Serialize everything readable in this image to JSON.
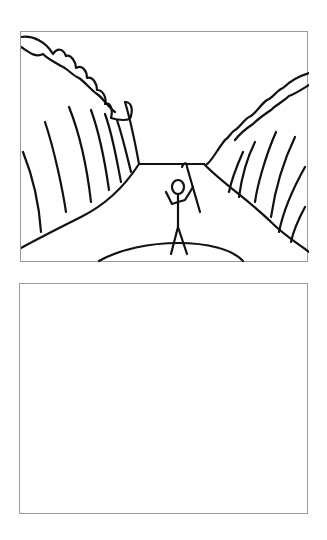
{
  "panels": [
    {
      "id": "top",
      "content": "drawing",
      "description": "Stick figure standing on a path between two rows of tall cliffs/trees, holding a staff",
      "border_color": "#9a9a9a"
    },
    {
      "id": "bottom",
      "content": "empty",
      "border_color": "#9a9a9a"
    }
  ],
  "colors": {
    "background": "#ffffff",
    "ink": "#111111",
    "border": "#9a9a9a"
  }
}
